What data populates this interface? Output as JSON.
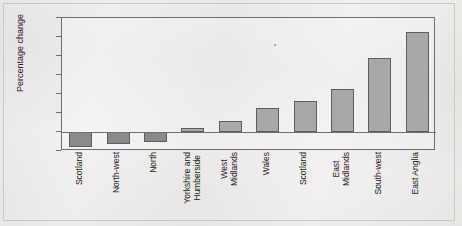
{
  "chart_data": {
    "type": "bar",
    "title": "",
    "subtitle": "",
    "xlabel": "",
    "ylabel": "Percentage change",
    "ylim": [
      -2,
      12
    ],
    "yticks": [
      12,
      10,
      8,
      6,
      4,
      2,
      0,
      -2
    ],
    "ytick_labels": [
      "12",
      "10",
      "8",
      "6",
      "4",
      "2",
      "0",
      "-2"
    ],
    "grid": false,
    "legend": null,
    "zero_line": 0,
    "categories": [
      "Scotland",
      "North-west",
      "North",
      "Yorkshire and Humberside",
      "West Midlands",
      "Wales",
      "Scotland",
      "East Midlands",
      "South-west",
      "East Anglia"
    ],
    "category_lines": [
      [
        "Scotland"
      ],
      [
        "North-west"
      ],
      [
        "North"
      ],
      [
        "Yorkshire and",
        "Humberside"
      ],
      [
        "West",
        "Midlands"
      ],
      [
        "Wales"
      ],
      [
        "Scotland"
      ],
      [
        "East",
        "Midlands"
      ],
      [
        "South-west"
      ],
      [
        "East Anglia"
      ]
    ],
    "values": [
      -1.6,
      -1.3,
      -1.1,
      0.4,
      1.2,
      2.5,
      3.3,
      4.5,
      7.8,
      10.5
    ],
    "colors": {
      "negative_bar": "#8a8a8a",
      "positive_bar": "#a8a8a8",
      "bar_border": "#5e5e5e",
      "axis": "#6f6f6f",
      "text": "#1b1b1b",
      "background": "#f2f1ef"
    }
  }
}
